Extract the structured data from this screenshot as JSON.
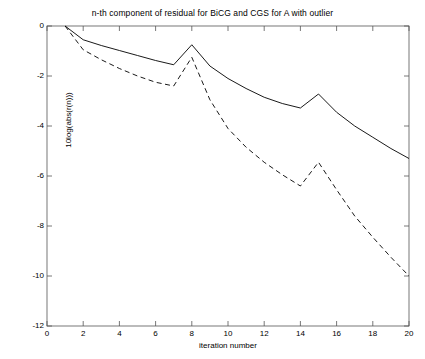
{
  "chart_data": {
    "type": "line",
    "title": "n-th component of residual for BiCG and CGS for A with outlier",
    "xlabel": "iteration number",
    "ylabel": "10log(abs(r(n)))",
    "xlim": [
      0,
      20
    ],
    "ylim": [
      -12,
      0
    ],
    "xticks": [
      0,
      2,
      4,
      6,
      8,
      10,
      12,
      14,
      16,
      18,
      20
    ],
    "xtick_labels": [
      "0",
      "2",
      "4",
      "6",
      "8",
      "10",
      "12",
      "14",
      "16",
      "18",
      "20"
    ],
    "yticks": [
      -12,
      -10,
      -8,
      -6,
      -4,
      -2,
      0
    ],
    "ytick_labels": [
      "-12",
      "-10",
      "-8",
      "-6",
      "-4",
      "-2",
      "0"
    ],
    "grid": false,
    "legend": null,
    "x": [
      1,
      2,
      3,
      4,
      5,
      6,
      7,
      8,
      9,
      10,
      11,
      12,
      13,
      14,
      15,
      16,
      17,
      18,
      19,
      20
    ],
    "series": [
      {
        "name": "BiCG",
        "style": "solid",
        "color": "#000000",
        "values": [
          0.0,
          -0.55,
          -0.78,
          -0.98,
          -1.18,
          -1.38,
          -1.55,
          -0.75,
          -1.6,
          -2.1,
          -2.5,
          -2.85,
          -3.1,
          -3.28,
          -2.72,
          -3.45,
          -4.0,
          -4.45,
          -4.9,
          -5.3
        ]
      },
      {
        "name": "CGS",
        "style": "dashed",
        "color": "#000000",
        "values": [
          0.0,
          -0.95,
          -1.35,
          -1.7,
          -2.0,
          -2.25,
          -2.4,
          -1.25,
          -2.95,
          -4.1,
          -4.85,
          -5.45,
          -5.95,
          -6.4,
          -5.45,
          -6.55,
          -7.6,
          -8.45,
          -9.25,
          -10.0
        ]
      }
    ]
  }
}
